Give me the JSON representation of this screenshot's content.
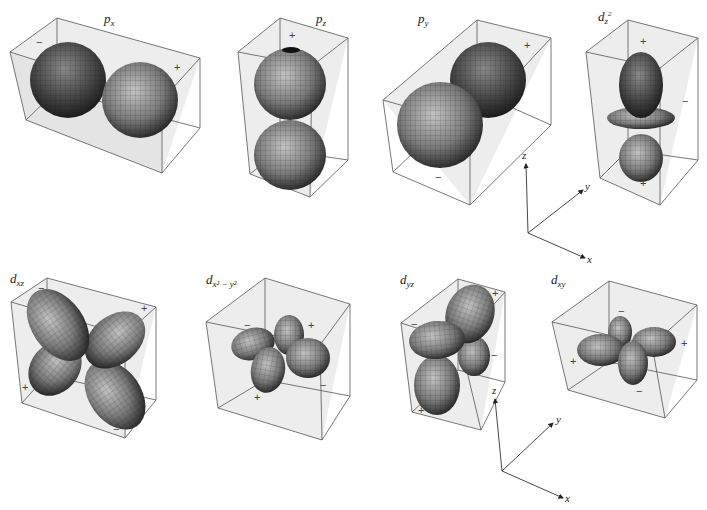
{
  "figure": {
    "rows": [
      {
        "orbitals": [
          {
            "id": "px",
            "label_main": "p",
            "label_sub": "x",
            "signs": [
              "−",
              "+"
            ]
          },
          {
            "id": "pz",
            "label_main": "p",
            "label_sub": "z",
            "signs": [
              "+",
              "−"
            ]
          },
          {
            "id": "py",
            "label_main": "p",
            "label_sub": "y",
            "signs": [
              "+",
              "−"
            ]
          },
          {
            "id": "dz2",
            "label_main": "d",
            "label_sub": "z",
            "label_sup": "2",
            "signs": [
              "+",
              "−",
              "+"
            ]
          }
        ]
      },
      {
        "orbitals": [
          {
            "id": "dxz",
            "label_main": "d",
            "label_sub": "xz",
            "signs": [
              "−",
              "+",
              "+",
              "−"
            ]
          },
          {
            "id": "dx2y2",
            "label_main": "d",
            "label_sub": "x² − y²",
            "signs": [
              "−",
              "+",
              "+",
              "−"
            ]
          },
          {
            "id": "dyz",
            "label_main": "d",
            "label_sub": "yz",
            "signs": [
              "−",
              "+",
              "−",
              "+"
            ]
          },
          {
            "id": "dxy",
            "label_main": "d",
            "label_sub": "xy",
            "signs": [
              "−",
              "+",
              "+",
              "−"
            ]
          }
        ]
      }
    ],
    "axes": [
      {
        "z": "z",
        "y": "y",
        "x": "x"
      },
      {
        "z": "z",
        "y": "y",
        "x": "x"
      }
    ]
  },
  "colors": {
    "box_fill": "#ececec",
    "box_stroke": "#555555",
    "lobe_light": "#b8b8b8",
    "lobe_dark": "#1a1a1a",
    "mesh": "#222222"
  }
}
